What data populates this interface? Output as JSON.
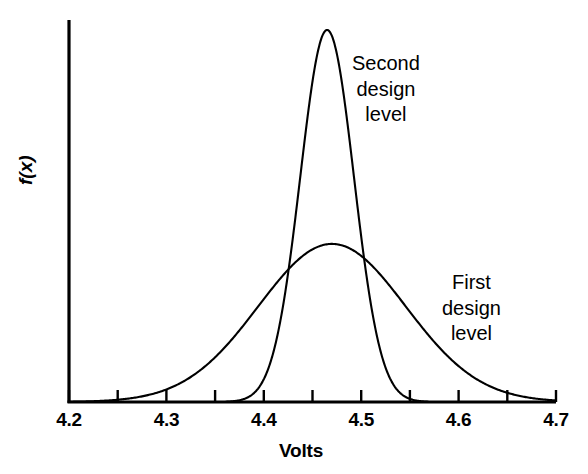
{
  "chart_data": {
    "type": "line",
    "title": "",
    "subtitle": "",
    "xlabel": "Volts",
    "ylabel": "f(x)",
    "xlim": [
      4.2,
      4.7
    ],
    "ylim": [
      0,
      1.0
    ],
    "grid": false,
    "legend_position": "inline-annotations",
    "x_tick_labels": [
      "4.2",
      "4.3",
      "4.4",
      "4.5",
      "4.6",
      "4.7"
    ],
    "x_tick_values": [
      4.2,
      4.3,
      4.4,
      4.5,
      4.6,
      4.7
    ],
    "x_minor_tick_values": [
      4.2,
      4.25,
      4.3,
      4.35,
      4.4,
      4.45,
      4.5,
      4.55,
      4.6,
      4.65,
      4.7
    ],
    "y_tick_labels": [],
    "y_tick_values": [],
    "line_color": "#000000",
    "line_width": 2.1,
    "series": [
      {
        "name": "First design level",
        "distribution": "normal",
        "mean": 4.47,
        "sigma": 0.0755,
        "peak_height": 0.425,
        "support": [
          4.2,
          4.7
        ],
        "annotation": "First design level",
        "annotation_x": 4.69,
        "annotation_y": 0.26,
        "x": [
          4.2,
          4.22,
          4.24,
          4.26,
          4.28,
          4.3,
          4.32,
          4.34,
          4.36,
          4.38,
          4.4,
          4.42,
          4.44,
          4.46,
          4.48,
          4.5,
          4.52,
          4.54,
          4.56,
          4.58,
          4.6,
          4.62,
          4.64,
          4.66,
          4.68,
          4.7
        ],
        "values": [
          0.01,
          0.016,
          0.024,
          0.036,
          0.053,
          0.075,
          0.104,
          0.14,
          0.183,
          0.232,
          0.283,
          0.333,
          0.377,
          0.409,
          0.424,
          0.422,
          0.402,
          0.368,
          0.324,
          0.275,
          0.225,
          0.178,
          0.136,
          0.1,
          0.072,
          0.05
        ]
      },
      {
        "name": "Second design level",
        "distribution": "normal",
        "mean": 4.465,
        "sigma": 0.0275,
        "peak_height": 1.0,
        "support": [
          4.37,
          4.56
        ],
        "annotation": "Second design level",
        "annotation_x": 4.555,
        "annotation_y": 0.83,
        "x": [
          4.36,
          4.37,
          4.38,
          4.39,
          4.4,
          4.41,
          4.42,
          4.43,
          4.44,
          4.45,
          4.46,
          4.465,
          4.47,
          4.48,
          4.49,
          4.5,
          4.51,
          4.52,
          4.53,
          4.54,
          4.55,
          4.56,
          4.57
        ],
        "values": [
          0.003,
          0.007,
          0.016,
          0.033,
          0.062,
          0.108,
          0.177,
          0.271,
          0.387,
          0.516,
          0.643,
          0.7,
          0.643,
          0.516,
          0.387,
          0.271,
          0.177,
          0.108,
          0.062,
          0.033,
          0.016,
          0.007,
          0.003
        ]
      }
    ],
    "annotations": [
      {
        "text_lines": [
          "Second",
          "design",
          "level"
        ],
        "x": 4.555,
        "y": 0.83
      },
      {
        "text_lines": [
          "First",
          "design",
          "level"
        ],
        "x": 4.69,
        "y": 0.26
      }
    ]
  },
  "axis": {
    "x_label": "Volts",
    "y_label": "f(x)",
    "ticks": [
      {
        "label": "4.2"
      },
      {
        "label": "4.3"
      },
      {
        "label": "4.4"
      },
      {
        "label": "4.5"
      },
      {
        "label": "4.6"
      },
      {
        "label": "4.7"
      }
    ]
  },
  "labels": {
    "second_line1": "Second",
    "second_line2": "design",
    "second_line3": "level",
    "first_line1": "First",
    "first_line2": "design",
    "first_line3": "level"
  }
}
